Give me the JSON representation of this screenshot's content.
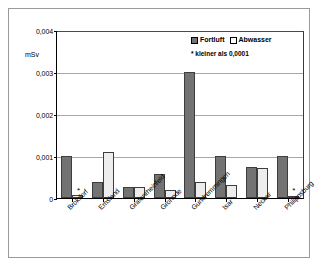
{
  "chart_data": {
    "type": "bar",
    "title": "",
    "xlabel": "",
    "ylabel": "mSv",
    "ylim": [
      0,
      0.004
    ],
    "ytick_labels": [
      "0,004",
      "0,003",
      "0,002",
      "0,001",
      "0"
    ],
    "ytick_values": [
      0.004,
      0.003,
      0.002,
      0.001,
      0
    ],
    "grid": true,
    "legend_position": "top-right",
    "categories": [
      "Brokdorf",
      "Emsland",
      "Grafenrheinfeld",
      "Grohnde",
      "Gundremmingen",
      "Isar",
      "Neckar",
      "Philippsburg"
    ],
    "series": [
      {
        "name": "Fortluft",
        "color": "#737373",
        "values": [
          0.001,
          0.00038,
          0.00027,
          0.00058,
          0.003,
          0.001,
          0.00074,
          0.001
        ]
      },
      {
        "name": "Abwasser",
        "color": "#ededed",
        "values": [
          6e-05,
          0.0011,
          0.00026,
          0.00018,
          0.00038,
          0.0003,
          0.00072,
          5e-05
        ]
      }
    ],
    "annotations": [
      {
        "category": "Brokdorf",
        "series": "Abwasser",
        "marker": "*"
      },
      {
        "category": "Philippsburg",
        "series": "Abwasser",
        "marker": "*"
      }
    ],
    "footnote": "*  kleiner als 0,0001"
  },
  "legend": {
    "fortluft_label": "Fortluft",
    "abwasser_label": "Abwasser"
  },
  "axis": {
    "y_unit": "mSv",
    "y0": "0,004",
    "y1": "0,003",
    "y2": "0,002",
    "y3": "0,001",
    "y4": "0"
  },
  "xlabels": {
    "l0": "Brokdorf",
    "l1": "Emsland",
    "l2": "Grafenrheinfeld",
    "l3": "Grohnde",
    "l4": "Gundremmingen",
    "l5": "Isar",
    "l6": "Neckar",
    "l7": "Philippsburg"
  },
  "note": "*  kleiner als 0,0001"
}
